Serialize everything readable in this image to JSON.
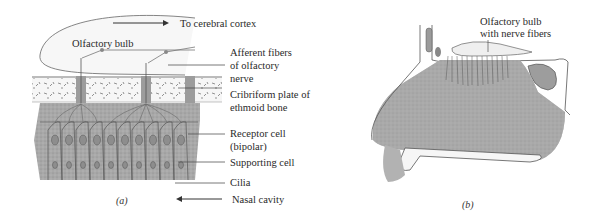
{
  "figure": {
    "panel_a": {
      "caption": "(a)",
      "labels": {
        "to_cortex": "To cerebral cortex",
        "bulb": "Olfactory bulb",
        "afferent_1": "Afferent fibers",
        "afferent_2": "of olfactory",
        "afferent_3": "nerve",
        "cribriform_1": "Cribriform plate of",
        "cribriform_2": "ethmoid bone",
        "receptor_1": "Receptor cell",
        "receptor_2": "(bipolar)",
        "supporting": "Supporting cell",
        "cilia": "Cilia",
        "nasal": "Nasal cavity"
      }
    },
    "panel_b": {
      "caption": "(b)",
      "labels": {
        "bulb_1": "Olfactory bulb",
        "bulb_2": "with nerve fibers"
      }
    },
    "colors": {
      "tissue": "#bdbdbd",
      "tissue_dark": "#9a9a9a",
      "line": "#555555",
      "bone_fill": "#f4f4f4"
    }
  }
}
